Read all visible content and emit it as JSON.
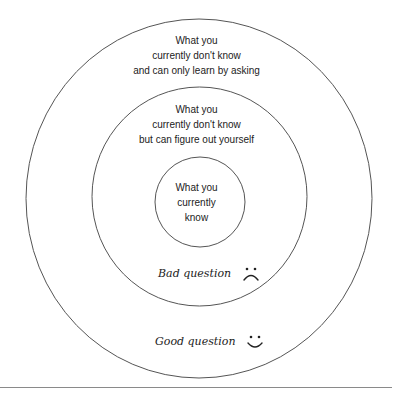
{
  "diagram": {
    "type": "concentric-circles",
    "colors": {
      "stroke": "#555555",
      "text": "#222222",
      "rule": "#8a8a8a",
      "background": "#ffffff"
    },
    "rings": [
      {
        "id": "outer",
        "lines": [
          "What you",
          "currently don't know",
          "and can only learn by asking"
        ]
      },
      {
        "id": "middle",
        "lines": [
          "What you",
          "currently don't know",
          "but can figure out yourself"
        ]
      },
      {
        "id": "inner",
        "lines": [
          "What you",
          "currently",
          "know"
        ]
      }
    ],
    "annotations": {
      "bad": {
        "label": "Bad question",
        "icon": "frown-face-icon"
      },
      "good": {
        "label": "Good question",
        "icon": "smile-face-icon"
      }
    }
  }
}
